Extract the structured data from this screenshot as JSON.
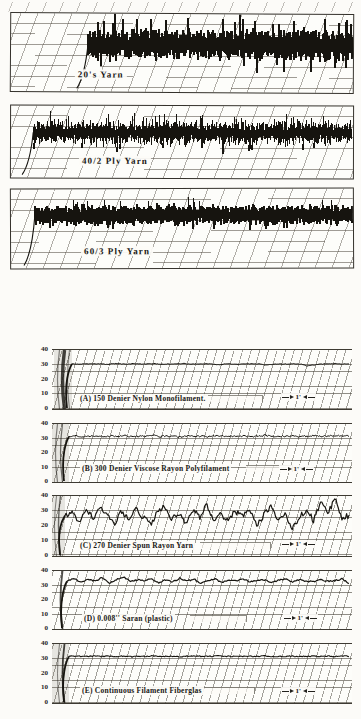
{
  "page": {
    "background": "#fcfbf8",
    "ink": "#16140f",
    "grid_color": "#52493f"
  },
  "chart_data": [
    {
      "id": "yarn-20s",
      "type": "line",
      "style": "dense-noise-band",
      "title": "20's Yarn",
      "band": {
        "center_frac": 0.39,
        "core_frac": 0.19,
        "spike_frac": 0.34,
        "start_frac": 0.225,
        "seed": 11,
        "stroke": 1.5
      }
    },
    {
      "id": "yarn-40-2-ply",
      "type": "line",
      "style": "dense-noise-band",
      "title": "40/2 Ply Yarn",
      "band": {
        "center_frac": 0.37,
        "core_frac": 0.16,
        "spike_frac": 0.26,
        "start_frac": 0.065,
        "seed": 23,
        "stroke": 1.4
      }
    },
    {
      "id": "yarn-60-3-ply",
      "type": "line",
      "style": "dense-noise-band",
      "title": "60/3 Ply Yarn",
      "band": {
        "center_frac": 0.33,
        "core_frac": 0.12,
        "spike_frac": 0.2,
        "start_frac": 0.07,
        "seed": 37,
        "stroke": 1.3
      }
    },
    {
      "id": "A",
      "type": "line",
      "title": "(A)   150 Denier Nylon Monofilament.",
      "ylim": [
        0,
        40
      ],
      "y_ticks": [
        40,
        30,
        20,
        10,
        0
      ],
      "scale_marker": "1'",
      "values": [
        30.6,
        30.4,
        30.7,
        30.5,
        30.6,
        30.3,
        30.7,
        30.6,
        30.4,
        30.8,
        30.5,
        30.6,
        30.7,
        30.3,
        30.6,
        30.5,
        30.9,
        30.4,
        30.6,
        30.5,
        30.7,
        29.9,
        30.5,
        30.6,
        30.4,
        30.7,
        30.5,
        30.6,
        29.7,
        30.3,
        30.6,
        30.5,
        30.7,
        30.4,
        29.3,
        29.9,
        30.5,
        30.6,
        30.7,
        30.5,
        30.6
      ],
      "seed": 101,
      "jitter": 0.22,
      "stroke": 1.0,
      "start_px": 20,
      "wash": true,
      "arcs": [
        {
          "dx": -9,
          "w": 3.4,
          "o": 0.8
        },
        {
          "dx": -14,
          "w": 1.2,
          "o": 0.5
        },
        {
          "dx": -4,
          "w": 1.2,
          "o": 0.45
        }
      ]
    },
    {
      "id": "B",
      "type": "line",
      "title": "(B)   300 Denier Viscose Rayon Polyfilament",
      "ylim": [
        0,
        40
      ],
      "y_ticks": [
        40,
        30,
        20,
        10,
        0
      ],
      "scale_marker": "1'",
      "values": [
        31.4,
        31.8,
        31.2,
        31.6,
        32.0,
        31.3,
        31.7,
        31.5,
        31.9,
        31.2,
        31.6,
        31.4,
        32.1,
        31.3,
        31.8,
        31.5,
        31.2,
        31.9,
        31.4,
        31.6,
        31.3,
        32.0,
        31.5,
        31.7,
        31.2,
        31.8,
        31.4,
        31.6,
        32.2,
        31.3,
        31.7,
        31.5,
        31.9,
        31.4,
        31.6,
        32.0,
        31.3,
        31.8,
        31.5,
        32.1,
        31.7
      ],
      "seed": 113,
      "jitter": 0.55,
      "stroke": 1.0,
      "start_px": 17,
      "wash": true,
      "arcs": [
        {
          "dx": -8,
          "w": 1.2,
          "o": 0.6
        },
        {
          "dx": -13,
          "w": 1.2,
          "o": 0.5
        }
      ]
    },
    {
      "id": "C",
      "type": "line",
      "title": "(C)   270 Denier Spun Rayon Yarn",
      "ylim": [
        0,
        40
      ],
      "y_ticks": [
        40,
        30,
        20,
        10,
        0
      ],
      "scale_marker": "1'",
      "values": [
        27,
        30,
        23,
        31,
        25,
        33,
        27,
        22,
        30,
        24,
        32,
        26,
        21,
        29,
        33,
        25,
        28,
        22,
        31,
        26,
        34,
        24,
        28,
        23,
        30,
        26,
        32,
        21,
        27,
        33,
        25,
        29,
        18,
        26,
        31,
        24,
        36,
        28,
        38,
        25,
        27
      ],
      "seed": 127,
      "jitter": 1.9,
      "stroke": 1.2,
      "start_px": 13,
      "wash": true,
      "arcs": [
        {
          "dx": -6,
          "w": 1.4,
          "o": 0.6
        },
        {
          "dx": -10,
          "w": 1.0,
          "o": 0.5
        }
      ]
    },
    {
      "id": "D",
      "type": "line",
      "title": "(D)   0.008''  Saran  (plastic)",
      "ylim": [
        0,
        40
      ],
      "y_ticks": [
        40,
        30,
        20,
        10,
        0
      ],
      "scale_marker": "1'",
      "values": [
        33,
        35,
        32,
        34.5,
        33,
        35.5,
        31.5,
        34,
        36,
        32.5,
        34,
        33,
        35,
        31.5,
        34,
        32.5,
        35,
        33,
        34.5,
        31.5,
        33.5,
        34.5,
        32,
        34,
        33,
        34.5,
        32.5,
        33.5,
        34,
        32,
        33.5,
        34.5,
        32.5,
        34,
        33,
        32.5,
        34,
        33,
        33.5,
        34.5,
        31.5
      ],
      "seed": 139,
      "jitter": 0.5,
      "stroke": 1.2,
      "start_px": 15,
      "wash": false,
      "arcs": [
        {
          "dx": -6,
          "w": 1.8,
          "o": 0.75
        }
      ]
    },
    {
      "id": "E",
      "type": "line",
      "title": "(E)   Continuous Filament Fiberglas",
      "ylim": [
        0,
        40
      ],
      "y_ticks": [
        40,
        30,
        20,
        10,
        0
      ],
      "scale_marker": "1'",
      "values": [
        31.6,
        31.8,
        31.5,
        31.7,
        31.9,
        31.5,
        31.7,
        31.6,
        31.8,
        31.4,
        31.7,
        31.6,
        31.9,
        31.5,
        31.7,
        31.6,
        31.4,
        31.8,
        31.6,
        31.7,
        31.5,
        31.9,
        31.6,
        31.7,
        31.5,
        31.8,
        31.6,
        31.7,
        32.0,
        31.5,
        31.7,
        31.6,
        31.8,
        31.5,
        31.7,
        31.9,
        31.5,
        31.8,
        31.6,
        31.9,
        31.7
      ],
      "seed": 151,
      "jitter": 0.35,
      "stroke": 1.1,
      "start_px": 17,
      "wash": true,
      "arcs": [
        {
          "dx": -6,
          "w": 1.8,
          "o": 0.8
        },
        {
          "dx": -11,
          "w": 1.0,
          "o": 0.5
        }
      ]
    }
  ]
}
